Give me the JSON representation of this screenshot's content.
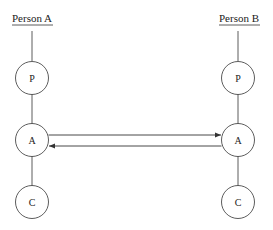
{
  "diagram": {
    "persons": [
      {
        "name": "Person A",
        "nodes": [
          {
            "label": "P"
          },
          {
            "label": "A"
          },
          {
            "label": "C"
          }
        ]
      },
      {
        "name": "Person B",
        "nodes": [
          {
            "label": "P"
          },
          {
            "label": "A"
          },
          {
            "label": "C"
          }
        ]
      }
    ],
    "transactions": [
      {
        "from": "Person A: A",
        "to": "Person B: A",
        "direction": "right"
      },
      {
        "from": "Person B: A",
        "to": "Person A: A",
        "direction": "left"
      }
    ],
    "colors": {
      "stroke": "#333333",
      "background": "#ffffff"
    }
  }
}
